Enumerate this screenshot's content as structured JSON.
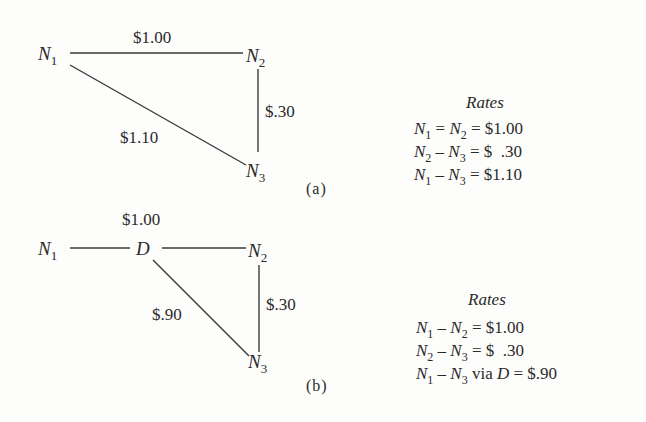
{
  "diagram_a": {
    "tag": "(a)",
    "nodes": {
      "n1": {
        "letter": "N",
        "sub": "1"
      },
      "n2": {
        "letter": "N",
        "sub": "2"
      },
      "n3": {
        "letter": "N",
        "sub": "3"
      }
    },
    "edges": {
      "n1_n2": "$1.00",
      "n2_n3": "$.30",
      "n1_n3": "$1.10"
    },
    "rates": {
      "title": "Rates",
      "rows": [
        {
          "a": "1",
          "op1": "=",
          "b": "2",
          "value": "= $1.00",
          "via": ""
        },
        {
          "a": "2",
          "op1": "–",
          "b": "3",
          "value": "= $  .30",
          "via": ""
        },
        {
          "a": "1",
          "op1": "–",
          "b": "3",
          "value": "= $1.10",
          "via": ""
        }
      ]
    }
  },
  "diagram_b": {
    "tag": "(b)",
    "nodes": {
      "n1": {
        "letter": "N",
        "sub": "1"
      },
      "d": {
        "letter": "D"
      },
      "n2": {
        "letter": "N",
        "sub": "2"
      },
      "n3": {
        "letter": "N",
        "sub": "3"
      }
    },
    "edges": {
      "n1_d_n2": "$1.00",
      "n2_n3": "$.30",
      "d_n3": "$.90"
    },
    "rates": {
      "title": "Rates",
      "rows": [
        {
          "a": "1",
          "op1": "–",
          "b": "2",
          "value": "= $1.00",
          "via_word": "",
          "via_node": ""
        },
        {
          "a": "2",
          "op1": "–",
          "b": "3",
          "value": "= $  .30",
          "via_word": "",
          "via_node": ""
        },
        {
          "a": "1",
          "op1": "–",
          "b": "3",
          "value": "= $.90",
          "via_word": "via",
          "via_node": "D"
        }
      ]
    }
  }
}
